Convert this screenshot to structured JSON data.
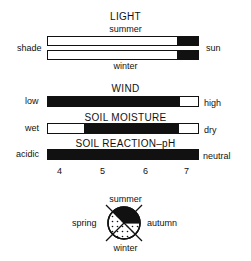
{
  "light": {
    "title": "LIGHT",
    "top_label": "summer",
    "bottom_label": "winter",
    "left_label": "shade",
    "right_label": "sun",
    "summer_bar": [
      {
        "fill": "white",
        "pct": 86
      },
      {
        "fill": "black",
        "pct": 14
      }
    ],
    "winter_bar": [
      {
        "fill": "white",
        "pct": 86
      },
      {
        "fill": "black",
        "pct": 14
      }
    ]
  },
  "wind": {
    "title": "WIND",
    "left_label": "low",
    "right_label": "high",
    "bar": [
      {
        "fill": "black",
        "pct": 88
      },
      {
        "fill": "white",
        "pct": 12
      }
    ]
  },
  "soil_moisture": {
    "title": "SOIL MOISTURE",
    "left_label": "wet",
    "right_label": "dry",
    "bar": [
      {
        "fill": "white",
        "pct": 24
      },
      {
        "fill": "black",
        "pct": 63
      },
      {
        "fill": "white",
        "pct": 13
      }
    ]
  },
  "soil_ph": {
    "title": "SOIL REACTION–pH",
    "left_label": "acidic",
    "right_label": "neutral",
    "bar": [
      {
        "fill": "black",
        "pct": 100
      }
    ],
    "ticks": [
      "4",
      "5",
      "6",
      "7"
    ]
  },
  "seasons": {
    "top": "summer",
    "bottom": "winter",
    "left": "spring",
    "right": "autumn",
    "filled_season": "summer",
    "colors": {
      "filled": "#111111",
      "dotted": "#ffffff"
    }
  }
}
